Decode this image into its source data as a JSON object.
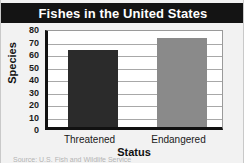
{
  "chart_data": {
    "type": "bar",
    "title": "Fishes in the United States",
    "xlabel": "Status",
    "ylabel": "Species",
    "categories": [
      "Threatened",
      "Endangered"
    ],
    "values": [
      62,
      71
    ],
    "series": [
      {
        "name": "Species",
        "values": [
          62,
          71
        ]
      }
    ],
    "ylim": [
      0,
      80
    ],
    "yticks": [
      0,
      10,
      20,
      30,
      40,
      50,
      60,
      70,
      80
    ],
    "ytick_labels": [
      "0",
      "10",
      "20",
      "30",
      "40",
      "50",
      "60",
      "70",
      "80"
    ],
    "grid": true,
    "legend": false,
    "bar_colors": [
      "#2b2b2b",
      "#8a8a8a"
    ]
  },
  "figure": {
    "title_band_color": "#141414",
    "title_text_color": "#ffffff",
    "background_color": "#f2f2f2",
    "plot_background_color": "#ffffff",
    "axis_color": "#111111",
    "gridline_color": "#a8a8a8"
  },
  "source_note": "Source: U.S. Fish and Wildlife Service"
}
